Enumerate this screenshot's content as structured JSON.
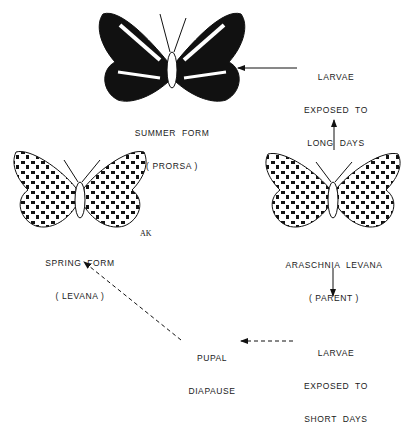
{
  "diagram": {
    "type": "seasonal-polyphenism-cycle",
    "nodes": {
      "summer": {
        "line1": "SUMMER  FORM",
        "line2": "( PRORSA )"
      },
      "spring": {
        "line1": "SPRING  FORM",
        "line2": "( LEVANA )"
      },
      "parent": {
        "line1": "ARASCHNIA  LEVANA",
        "line2": "( PARENT )"
      },
      "long_days": {
        "line1": "LARVAE",
        "line2": "EXPOSED  TO",
        "line3": "LONG  DAYS"
      },
      "short_days": {
        "line1": "LARVAE",
        "line2": "EXPOSED  TO",
        "line3": "SHORT  DAYS"
      },
      "diapause": {
        "line1": "PUPAL",
        "line2": "DIAPAUSE"
      }
    },
    "edges": [
      {
        "from": "parent",
        "to": "long_days",
        "style": "solid"
      },
      {
        "from": "long_days",
        "to": "summer",
        "style": "solid"
      },
      {
        "from": "parent",
        "to": "short_days",
        "style": "solid"
      },
      {
        "from": "short_days",
        "to": "diapause",
        "style": "dashed"
      },
      {
        "from": "diapause",
        "to": "spring",
        "style": "dashed"
      }
    ],
    "signature": "AK"
  }
}
